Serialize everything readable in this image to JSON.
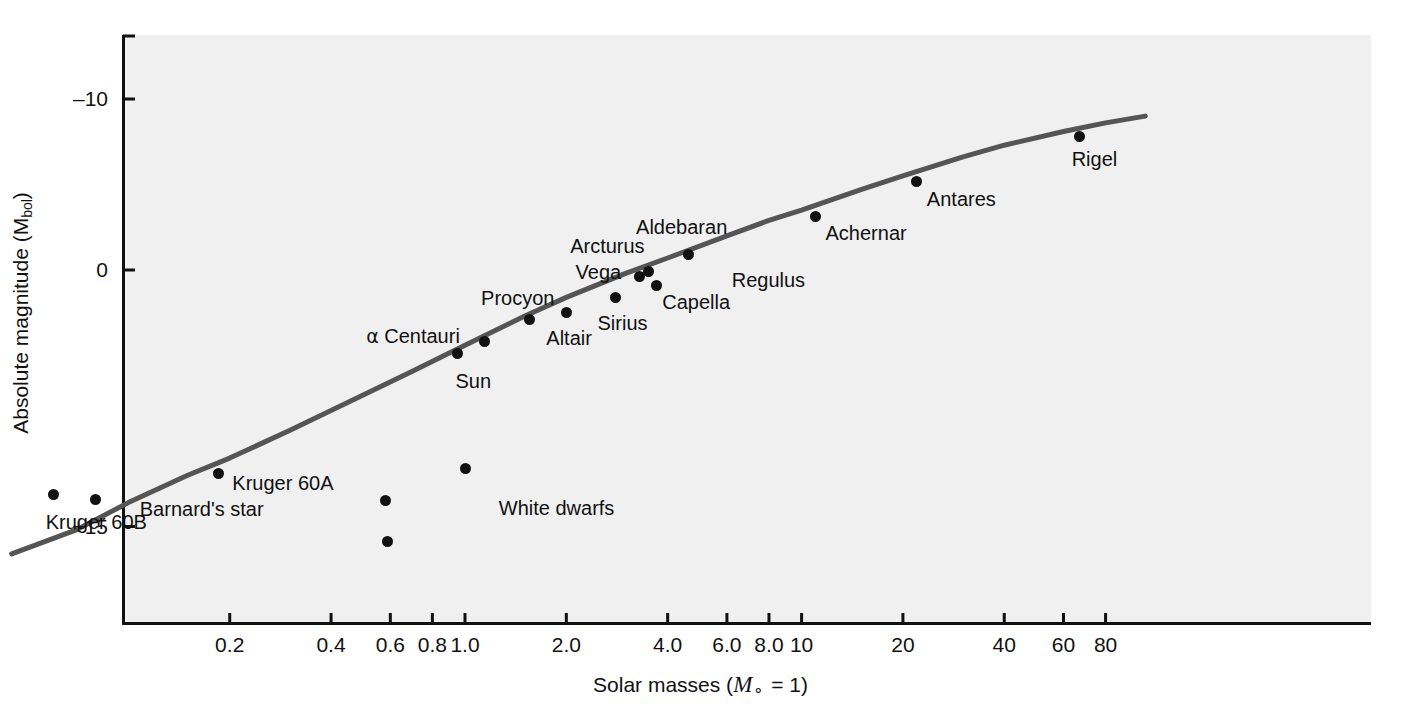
{
  "chart_data": {
    "type": "scatter",
    "title": "",
    "xlabel": "Solar masses (M⊙ = 1)",
    "ylabel": "Absolute magnitude (Mbol)",
    "xscale": "log",
    "xlim": [
      0.04,
      110
    ],
    "ylim": [
      -13.5,
      20.5
    ],
    "grid": false,
    "legend": null,
    "y_ticks": [
      {
        "value": -10,
        "label": "–10"
      },
      {
        "value": 0,
        "label": "0"
      },
      {
        "value": 15,
        "label": "+15"
      }
    ],
    "x_ticks": [
      {
        "value": 0.2,
        "label": "0.2"
      },
      {
        "value": 0.4,
        "label": "0.4"
      },
      {
        "value": 0.6,
        "label": "0.6"
      },
      {
        "value": 0.8,
        "label": "0.8"
      },
      {
        "value": 1.0,
        "label": "1.0"
      },
      {
        "value": 2.0,
        "label": "2.0"
      },
      {
        "value": 4.0,
        "label": "4.0"
      },
      {
        "value": 6.0,
        "label": "6.0"
      },
      {
        "value": 8.0,
        "label": "8.0"
      },
      {
        "value": 10,
        "label": "10"
      },
      {
        "value": 20,
        "label": "20"
      },
      {
        "value": 40,
        "label": "40"
      },
      {
        "value": 60,
        "label": "60"
      },
      {
        "value": 80,
        "label": "80"
      }
    ],
    "series": [
      {
        "name": "main sequence",
        "type": "line",
        "color": "#555555",
        "points": [
          {
            "mass": 0.045,
            "magnitude": 16.6
          },
          {
            "mass": 0.07,
            "magnitude": 15.2
          },
          {
            "mass": 0.1,
            "magnitude": 13.6
          },
          {
            "mass": 0.15,
            "magnitude": 12.0
          },
          {
            "mass": 0.2,
            "magnitude": 11.0
          },
          {
            "mass": 0.3,
            "magnitude": 9.4
          },
          {
            "mass": 0.5,
            "magnitude": 7.3
          },
          {
            "mass": 0.7,
            "magnitude": 5.9
          },
          {
            "mass": 1.0,
            "magnitude": 4.4
          },
          {
            "mass": 1.5,
            "magnitude": 2.7
          },
          {
            "mass": 2.0,
            "magnitude": 1.6
          },
          {
            "mass": 3.0,
            "magnitude": 0.2
          },
          {
            "mass": 4.0,
            "magnitude": -0.7
          },
          {
            "mass": 6.0,
            "magnitude": -2.0
          },
          {
            "mass": 8.0,
            "magnitude": -2.9
          },
          {
            "mass": 10,
            "magnitude": -3.5
          },
          {
            "mass": 15,
            "magnitude": -4.7
          },
          {
            "mass": 20,
            "magnitude": -5.5
          },
          {
            "mass": 30,
            "magnitude": -6.6
          },
          {
            "mass": 40,
            "magnitude": -7.3
          },
          {
            "mass": 60,
            "magnitude": -8.1
          },
          {
            "mass": 80,
            "magnitude": -8.6
          },
          {
            "mass": 105,
            "magnitude": -9.0
          }
        ]
      },
      {
        "name": "stars",
        "type": "scatter",
        "color": "#111111",
        "points": [
          {
            "label": "Kruger 60B",
            "mass": 0.06,
            "magnitude": 13.1,
            "label_dx": -8,
            "label_dy": 28,
            "label_anchor": "start"
          },
          {
            "label": "Barnard's star",
            "mass": 0.08,
            "magnitude": 13.4,
            "label_dx": 44,
            "label_dy": 10,
            "label_anchor": "start"
          },
          {
            "label": "Kruger 60A",
            "mass": 0.185,
            "magnitude": 11.9,
            "label_dx": 14,
            "label_dy": 10,
            "label_anchor": "start"
          },
          {
            "label": "Sun",
            "mass": 0.95,
            "magnitude": 4.9,
            "label_dx": -2,
            "label_dy": 27,
            "label_anchor": "start"
          },
          {
            "label": "α Centauri",
            "mass": 1.14,
            "magnitude": 4.2,
            "label_dx": -118,
            "label_dy": -6,
            "label_anchor": "start"
          },
          {
            "label": "Procyon",
            "mass": 1.55,
            "magnitude": 2.9,
            "label_dx": -48,
            "label_dy": -22,
            "label_anchor": "start"
          },
          {
            "label": "Altair",
            "mass": 2.0,
            "magnitude": 2.5,
            "label_dx": -20,
            "label_dy": 25,
            "label_anchor": "start"
          },
          {
            "label": "Sirius",
            "mass": 2.8,
            "magnitude": 1.6,
            "label_dx": -18,
            "label_dy": 26,
            "label_anchor": "start"
          },
          {
            "label": "Vega",
            "mass": 3.3,
            "magnitude": 0.4,
            "label_dx": -64,
            "label_dy": -5,
            "label_anchor": "start"
          },
          {
            "label": "Arcturus",
            "mass": 3.5,
            "magnitude": 0.1,
            "label_dx": -78,
            "label_dy": -26,
            "label_anchor": "start"
          },
          {
            "label": "Capella",
            "mass": 3.7,
            "magnitude": 0.9,
            "label_dx": 6,
            "label_dy": 17,
            "label_anchor": "start"
          },
          {
            "label": "Aldebaran",
            "mass": 4.6,
            "magnitude": -0.9,
            "label_dx": -52,
            "label_dy": -28,
            "label_anchor": "start"
          },
          {
            "label": "Achernar",
            "mass": 11.0,
            "magnitude": -3.1,
            "label_dx": 10,
            "label_dy": 16,
            "label_anchor": "start"
          },
          {
            "label": "Antares",
            "mass": 22.0,
            "magnitude": -5.2,
            "label_dx": 10,
            "label_dy": 18,
            "label_anchor": "start"
          },
          {
            "label": "Rigel",
            "mass": 67.0,
            "magnitude": -7.8,
            "label_dx": -8,
            "label_dy": 22,
            "label_anchor": "start"
          }
        ]
      },
      {
        "name": "White dwarfs",
        "type": "scatter",
        "color": "#111111",
        "group_label": "White dwarfs",
        "group_label_mass": 1.26,
        "group_label_magnitude": 13.9,
        "points": [
          {
            "mass": 1.0,
            "magnitude": 11.6
          },
          {
            "mass": 0.58,
            "magnitude": 13.5
          },
          {
            "mass": 0.59,
            "magnitude": 15.9
          }
        ]
      }
    ],
    "unlabeled_annotations": [
      {
        "text": "Regulus",
        "mass": 6.2,
        "magnitude": 0.6
      }
    ]
  }
}
